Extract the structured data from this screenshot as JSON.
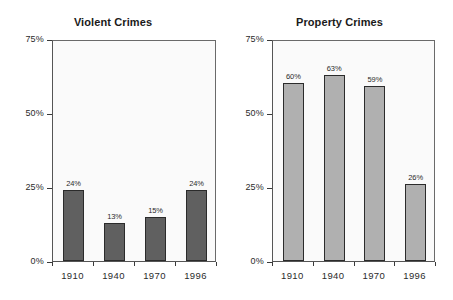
{
  "chart_data": [
    {
      "type": "bar",
      "title": "Violent Crimes",
      "xlabel": "",
      "ylabel": "",
      "categories": [
        "1910",
        "1940",
        "1970",
        "1996"
      ],
      "values": [
        24,
        13,
        15,
        24
      ],
      "value_labels": [
        "24%",
        "13%",
        "15%",
        "24%"
      ],
      "ylim": [
        0,
        75
      ],
      "yticks": [
        0,
        25,
        50,
        75
      ],
      "ytick_labels": [
        "0%",
        "25%",
        "50%",
        "75%"
      ],
      "grid": false,
      "legend": "none",
      "bar_color": "#606060",
      "bar_edge_color": "#2b2b2b"
    },
    {
      "type": "bar",
      "title": "Property Crimes",
      "xlabel": "",
      "ylabel": "",
      "categories": [
        "1910",
        "1940",
        "1970",
        "1996"
      ],
      "values": [
        60,
        63,
        59,
        26
      ],
      "value_labels": [
        "60%",
        "63%",
        "59%",
        "26%"
      ],
      "ylim": [
        0,
        75
      ],
      "yticks": [
        0,
        25,
        50,
        75
      ],
      "ytick_labels": [
        "0%",
        "25%",
        "50%",
        "75%"
      ],
      "grid": false,
      "legend": "none",
      "bar_color": "#b0b0b0",
      "bar_edge_color": "#2b2b2b"
    }
  ],
  "figure": {
    "background": "#ffffff",
    "panel_background": "#fafafa",
    "axis_color": "#555555"
  }
}
